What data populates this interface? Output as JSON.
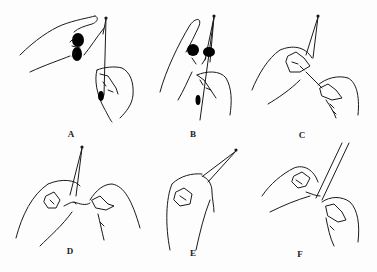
{
  "figure": {
    "panels": [
      {
        "id": "A",
        "label": "A"
      },
      {
        "id": "B",
        "label": "B"
      },
      {
        "id": "C",
        "label": "C"
      },
      {
        "id": "D",
        "label": "D"
      },
      {
        "id": "E",
        "label": "E"
      },
      {
        "id": "F",
        "label": "F"
      }
    ],
    "colors": {
      "line": "#1a1a1a",
      "background": "#fdfdfd"
    }
  }
}
